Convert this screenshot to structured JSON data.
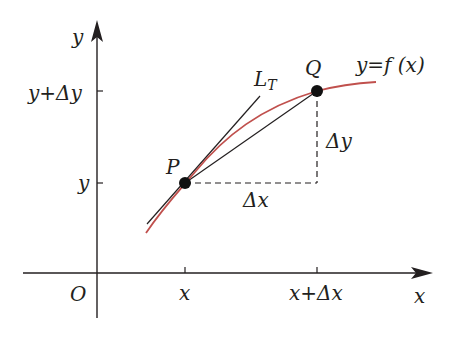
{
  "diagram": {
    "colors": {
      "curve": "#c0504d",
      "lines": "#231f20",
      "background": "#ffffff"
    },
    "axes": {
      "x_label": "x",
      "y_label": "y",
      "origin_label": "O",
      "x_ticks": [
        "x",
        "x+Δx"
      ],
      "y_ticks": [
        "y",
        "y+Δy"
      ]
    },
    "points": {
      "P": {
        "label": "P"
      },
      "Q": {
        "label": "Q"
      }
    },
    "curve_label": "y=f (x)",
    "tangent_label": "L",
    "tangent_subscript": "T",
    "delta_x_label": "Δx",
    "delta_y_label": "Δy",
    "tick_labels": {
      "x": "x",
      "x_plus_dx": "x+Δx",
      "y": "y",
      "y_plus_dy": "y+Δy"
    }
  }
}
